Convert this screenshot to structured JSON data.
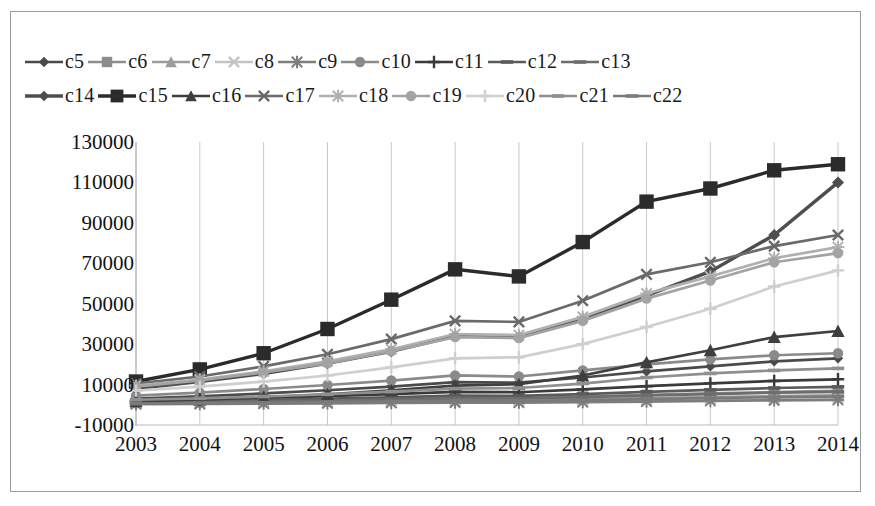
{
  "chart_data": {
    "type": "line",
    "title": "",
    "xlabel": "",
    "ylabel": "",
    "categories": [
      "2003",
      "2004",
      "2005",
      "2006",
      "2007",
      "2008",
      "2009",
      "2010",
      "2011",
      "2012",
      "2013",
      "2014"
    ],
    "ylim": [
      -10000,
      130000
    ],
    "ytick_step": 20000,
    "yticks": [
      "130000",
      "110000",
      "90000",
      "70000",
      "50000",
      "30000",
      "10000",
      "-10000"
    ],
    "grid": "vertical",
    "legend_position": "top",
    "series": [
      {
        "name": "c5",
        "marker": "diamond",
        "color": "#4a4a4a",
        "values": [
          3000,
          4200,
          5600,
          7200,
          9000,
          11200,
          11000,
          13500,
          16500,
          19000,
          21500,
          23000
        ]
      },
      {
        "name": "c6",
        "marker": "square",
        "color": "#8d8d8d",
        "values": [
          1200,
          1500,
          1900,
          2400,
          2900,
          3500,
          3400,
          4100,
          4900,
          5600,
          6300,
          6900
        ]
      },
      {
        "name": "c7",
        "marker": "triangle",
        "color": "#9c9c9c",
        "values": [
          800,
          1000,
          1300,
          1600,
          2000,
          2400,
          2300,
          2800,
          3300,
          3800,
          4300,
          4700
        ]
      },
      {
        "name": "c8",
        "marker": "x",
        "color": "#c4c4c4",
        "values": [
          500,
          700,
          900,
          1100,
          1400,
          1700,
          1600,
          2000,
          2400,
          2800,
          3200,
          3500
        ]
      },
      {
        "name": "c9",
        "marker": "asterisk",
        "color": "#7d7d7d",
        "values": [
          300,
          400,
          550,
          700,
          900,
          1100,
          1050,
          1300,
          1600,
          1900,
          2200,
          2400
        ]
      },
      {
        "name": "c10",
        "marker": "circle",
        "color": "#8a8a8a",
        "values": [
          4500,
          6000,
          7800,
          9800,
          12000,
          14500,
          14000,
          17000,
          20000,
          22500,
          24500,
          25500
        ]
      },
      {
        "name": "c11",
        "marker": "plus",
        "color": "#3a3a3a",
        "values": [
          2000,
          2600,
          3400,
          4300,
          5300,
          6400,
          6200,
          7600,
          9200,
          10600,
          11800,
          12600
        ]
      },
      {
        "name": "c12",
        "marker": "dash",
        "color": "#5b5b5b",
        "values": [
          1500,
          1900,
          2400,
          3000,
          3700,
          4500,
          4400,
          5300,
          6400,
          7400,
          8300,
          8900
        ]
      },
      {
        "name": "c13",
        "marker": "dash",
        "color": "#6d6d6d",
        "values": [
          1000,
          1300,
          1700,
          2100,
          2600,
          3200,
          3100,
          3800,
          4600,
          5300,
          6000,
          6400
        ]
      },
      {
        "name": "c14",
        "marker": "diamond",
        "color": "#4e4e4e",
        "values": [
          8000,
          11500,
          15500,
          20500,
          26500,
          34000,
          33500,
          42500,
          54000,
          66000,
          84000,
          110000
        ]
      },
      {
        "name": "c15",
        "marker": "square",
        "color": "#2b2b2b",
        "values": [
          11500,
          17500,
          25500,
          37500,
          52000,
          67000,
          63500,
          80500,
          100500,
          107000,
          116000,
          119000
        ]
      },
      {
        "name": "c16",
        "marker": "triangle",
        "color": "#3f3f3f",
        "values": [
          1800,
          2600,
          3700,
          5200,
          7200,
          9500,
          10200,
          14500,
          21000,
          27000,
          33500,
          36500
        ]
      },
      {
        "name": "c17",
        "marker": "x",
        "color": "#6a6a6a",
        "values": [
          10500,
          14000,
          19000,
          25000,
          32500,
          41500,
          41000,
          51500,
          64500,
          70500,
          78500,
          84000
        ]
      },
      {
        "name": "c18",
        "marker": "asterisk",
        "color": "#b0b0b0",
        "values": [
          9500,
          12500,
          16500,
          21500,
          27500,
          35000,
          34500,
          43500,
          55000,
          63500,
          72500,
          78000
        ]
      },
      {
        "name": "c19",
        "marker": "circle",
        "color": "#a3a3a3",
        "values": [
          9000,
          12000,
          16000,
          20500,
          26500,
          33500,
          33000,
          41500,
          52500,
          61500,
          70500,
          75000
        ]
      },
      {
        "name": "c20",
        "marker": "plus",
        "color": "#cfcfcf",
        "values": [
          7000,
          9000,
          11500,
          14500,
          18500,
          23000,
          23500,
          30000,
          38500,
          47500,
          58500,
          66500
        ]
      },
      {
        "name": "c21",
        "marker": "dash",
        "color": "#8f8f8f",
        "values": [
          2500,
          3200,
          4100,
          5200,
          6500,
          8000,
          8300,
          10500,
          13500,
          15500,
          17000,
          18000
        ]
      },
      {
        "name": "c22",
        "marker": "dash",
        "color": "#7a7a7a",
        "values": [
          600,
          800,
          1000,
          1300,
          1600,
          2000,
          1900,
          2300,
          2800,
          3300,
          3800,
          4100
        ]
      }
    ]
  },
  "legend": {
    "rows": [
      [
        "c5",
        "c6",
        "c7",
        "c8",
        "c9",
        "c10",
        "c11",
        "c12",
        "c13"
      ],
      [
        "c14",
        "c15",
        "c16",
        "c17",
        "c18",
        "c19",
        "c20",
        "c21",
        "c22"
      ]
    ]
  }
}
